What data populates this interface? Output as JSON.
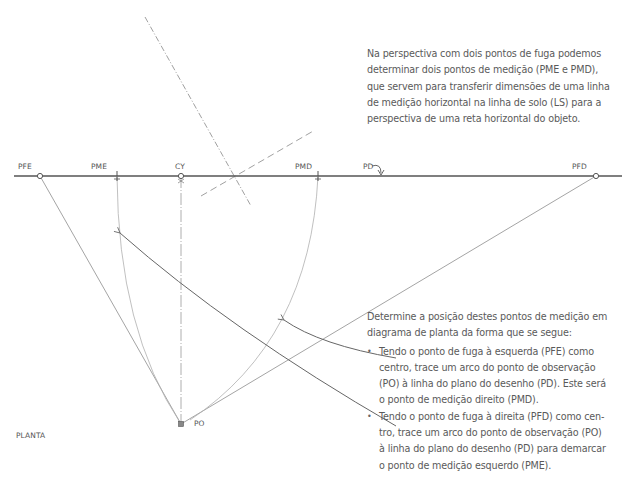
{
  "labels": {
    "pfe": "PFE",
    "pme": "PME",
    "cy": "CY",
    "pmd": "PMD",
    "pd": "PD",
    "pfd": "PFD",
    "po": "PO",
    "planta": "PLANTA"
  },
  "notes": {
    "top": [
      "Na perspectiva com dois pontos de fuga podemos",
      "determinar dois pontos de medição (PME e PMD),",
      "que servem para transferir dimensões de uma linha",
      "de medição horizontal na linha de solo (LS) para a",
      "perspectiva de uma reta horizontal do objeto."
    ],
    "intro": [
      "Determine a posição destes pontos de medição em",
      "diagrama de planta da forma que se segue:"
    ],
    "bullet1": [
      "Tendo o ponto de fuga à esquerda (PFE) como",
      "centro, trace um arco do ponto de observação",
      "(PO) à linha do plano do desenho (PD). Este será",
      "o ponto de medição direito (PMD)."
    ],
    "bullet2": [
      "Tendo o ponto de fuga à direita (PFD) como cen-",
      "tro, trace um arco do ponto de observação (PO)",
      "à linha do plano do desenho (PD) para demarcar",
      "o ponto de medição esquerdo (PME)."
    ]
  },
  "colors": {
    "line_dark": "#555555",
    "line_light": "#9a9a9a",
    "text": "#5a5a5a"
  }
}
